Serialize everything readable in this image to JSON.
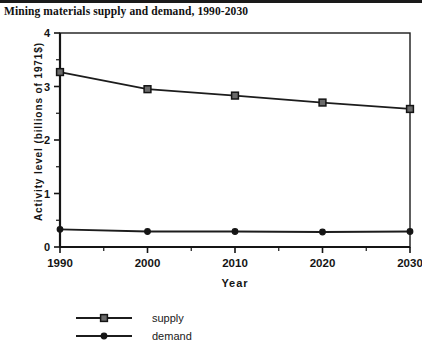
{
  "chart_data": {
    "type": "line",
    "title": "Mining materials supply and demand, 1990-2030",
    "xlabel": "Year",
    "ylabel": "Activity level (billions of 1971$)",
    "x": [
      1990,
      2000,
      2010,
      2020,
      2030
    ],
    "xtick_labels": [
      "1990",
      "2000",
      "2010",
      "2020",
      "2030"
    ],
    "ytick_labels": [
      "0",
      "1",
      "2",
      "3",
      "4"
    ],
    "ytick_values": [
      0,
      1,
      2,
      3,
      4
    ],
    "yminor_values": [
      0.5,
      1.5,
      2.5,
      3.5
    ],
    "xlim": [
      1990,
      2030
    ],
    "ylim": [
      0,
      4
    ],
    "grid": false,
    "legend_position": "bottom-left",
    "series": [
      {
        "name": "supply",
        "marker": "square-open",
        "values": [
          3.27,
          2.95,
          2.83,
          2.7,
          2.58
        ]
      },
      {
        "name": "demand",
        "marker": "circle-filled",
        "values": [
          0.33,
          0.29,
          0.29,
          0.28,
          0.29
        ]
      }
    ]
  },
  "legend": {
    "items": [
      {
        "label": "supply"
      },
      {
        "label": "demand"
      }
    ]
  },
  "colors": {
    "ink": "#1a1a1a",
    "marker_fill": "#6a6a6a",
    "background": "#ffffff"
  }
}
